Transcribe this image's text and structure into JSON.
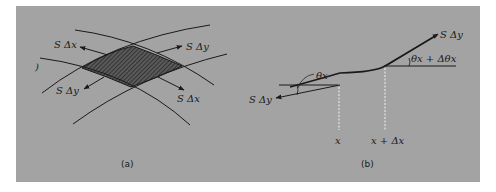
{
  "figure": {
    "panel_color": "#a3a3a3",
    "line_color": "#1a1a1a",
    "subfigures": [
      {
        "id": "a",
        "caption": "(a)",
        "description": "Shaded membrane element bounded by four curves with tension forces",
        "labels": {
          "top_left": "S Δx",
          "top_right": "S Δy",
          "bottom_left": "S Δy",
          "bottom_right": "S Δx"
        }
      },
      {
        "id": "b",
        "caption": "(b)",
        "description": "Membrane cross-section with tension at angles",
        "labels": {
          "left_force": "S Δy",
          "right_force": "S Δy",
          "left_angle": "θx",
          "right_angle": "θx + Δθx",
          "x_left": "x",
          "x_right": "x + Δx"
        }
      }
    ]
  }
}
